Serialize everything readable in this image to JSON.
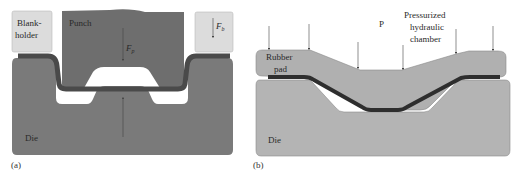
{
  "panel_a": {
    "caption": "(a)",
    "labels": {
      "blankholder_line1": "Blank-",
      "blankholder_line2": "holder",
      "punch": "Punch",
      "die": "Die",
      "force_punch_main": "F",
      "force_punch_sub": "p",
      "force_blank_main": "F",
      "force_blank_sub": "b"
    }
  },
  "panel_b": {
    "caption": "(b)",
    "labels": {
      "rubber_line1": "Rubber",
      "rubber_line2": "pad",
      "pressure": "P",
      "chamber_line1": "Pressurized",
      "chamber_line2": "hydraulic",
      "chamber_line3": "chamber",
      "die": "Die"
    }
  },
  "colors": {
    "die_a": "#7a7a7a",
    "punch": "#6e6e6e",
    "blankholder": "#dcdcdc",
    "sheet_a": "#4a4a4a",
    "die_b": "#b4b4b4",
    "rubber": "#b0b0b0",
    "sheet_b": "#2e2e2e",
    "outline": "#8a8a8a",
    "arrow": "#444444"
  }
}
